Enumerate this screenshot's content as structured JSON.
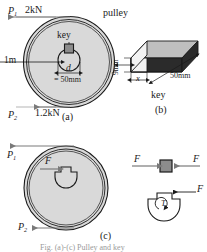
{
  "figure": {
    "caption": "Fig. (a)-(c) Pulley and key",
    "parts": [
      {
        "id": "a",
        "label": "(a)",
        "title": "pulley with key"
      },
      {
        "id": "b",
        "label": "(b)",
        "title": "key"
      },
      {
        "id": "c",
        "label": "(c)",
        "title": "free body diagrams"
      }
    ]
  },
  "part_a": {
    "label": "(a)",
    "pulley_label": "pulley",
    "key_label": "key",
    "force_top_symbol": "P",
    "force_top_sub": "1",
    "force_top_value": "2kN",
    "force_bottom_symbol": "P",
    "force_bottom_sub": "2",
    "force_bottom_value": "1.2kN",
    "diameter_label": "1m",
    "shaft_symbol": "d",
    "shaft_value": "= 50mm"
  },
  "part_b": {
    "label": "(b)",
    "name": "key",
    "height_dim": "9mm",
    "width_dim": "x",
    "length_dim": "50mm"
  },
  "part_c": {
    "label": "(c)",
    "force_top_symbol": "P",
    "force_top_sub": "1",
    "force_bottom_symbol": "P",
    "force_bottom_sub": "2",
    "force_key_label": "F",
    "key_force_left": "F",
    "key_force_right": "F",
    "shaft_force": "F",
    "torque_label": "T"
  },
  "colors": {
    "line": "#1a1a1a",
    "pulley_fill": "#d9d9d9",
    "key_fill": "#8c8c8c",
    "key_dark_face": "#2b2b2b",
    "key_light_face": "#f2f2f2",
    "key_mid_face": "#bfbfbf",
    "arrow": "#7a7a7a"
  }
}
